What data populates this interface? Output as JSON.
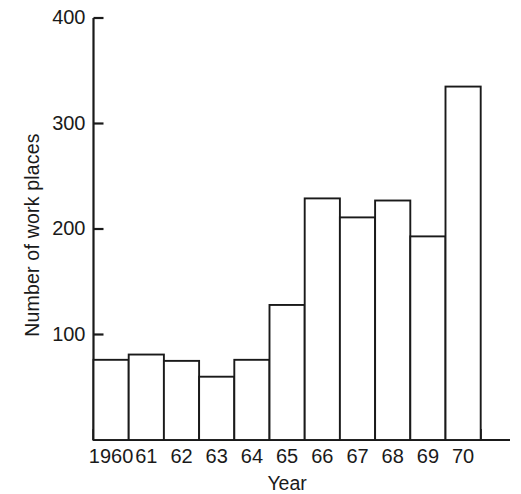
{
  "chart_data": {
    "type": "bar",
    "title": "",
    "subtitle": "",
    "xlabel": "Year",
    "ylabel": "Number of work places",
    "categories": [
      "1960",
      "61",
      "62",
      "63",
      "64",
      "65",
      "66",
      "67",
      "68",
      "69",
      "70"
    ],
    "values": [
      76,
      81,
      75,
      60,
      76,
      128,
      229,
      211,
      227,
      193,
      335
    ],
    "ytick_labels": [
      "100",
      "200",
      "300",
      "400"
    ],
    "ytick_values": [
      100,
      200,
      300,
      400
    ],
    "ylim": [
      0,
      400
    ],
    "xlim_categories": 11,
    "grid": false,
    "legend": null,
    "legend_position": "none",
    "bar_fill": "#ffffff",
    "bar_edge_color": "#1a1a1a",
    "axis_color": "#1a1a1a",
    "background": "#ffffff",
    "annotations": []
  }
}
